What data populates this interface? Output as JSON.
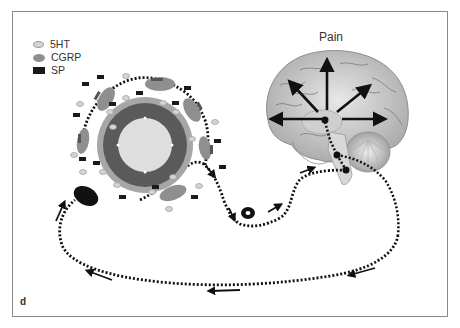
{
  "legend": {
    "items": [
      {
        "label": "5HT",
        "shape": "light-ellipse",
        "color": "#d4d4d4"
      },
      {
        "label": "CGRP",
        "shape": "gray-ellipse",
        "color": "#8f8f8f"
      },
      {
        "label": "SP",
        "shape": "black-rectangle",
        "color": "#1a1a1a"
      }
    ]
  },
  "brain": {
    "label": "Pain"
  },
  "panel": {
    "label": "d"
  },
  "colors": {
    "frame": "#8a8a8a",
    "cell_outer": "#a6a6a6",
    "cell_ring": "#5a5a5a",
    "cell_inner": "#dedede",
    "pathway": "#111111"
  }
}
